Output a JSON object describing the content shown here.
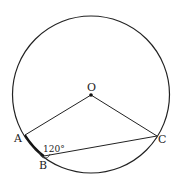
{
  "diagram": {
    "type": "circle-geometry",
    "circle": {
      "cx": 91,
      "cy": 94.5,
      "r": 78,
      "stroke": "#222222"
    },
    "center": {
      "label": "O",
      "x": 91,
      "y": 95
    },
    "points": {
      "A": {
        "label": "A",
        "x": 25,
        "y": 135
      },
      "B": {
        "label": "B",
        "x": 44,
        "y": 156
      },
      "C": {
        "label": "C",
        "x": 157,
        "y": 136
      }
    },
    "segments": [
      {
        "from": "O",
        "to": "A"
      },
      {
        "from": "O",
        "to": "C"
      },
      {
        "from": "A",
        "to": "B"
      },
      {
        "from": "B",
        "to": "C"
      }
    ],
    "angle": {
      "vertex": "B",
      "label": "120°"
    }
  }
}
